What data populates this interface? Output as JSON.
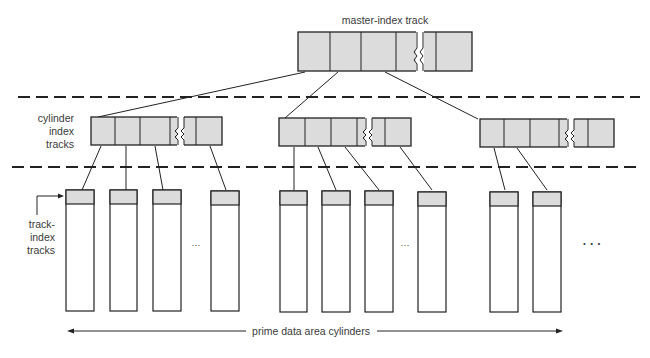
{
  "diagram": {
    "labels": {
      "master_index": "master-index track",
      "cylinder_index": [
        "cylinder",
        "index",
        "tracks"
      ],
      "track_index": [
        "track-",
        "index",
        "tracks"
      ],
      "prime_data": "prime data area cylinders",
      "ellipsis_small": "···",
      "ellipsis_large": "· · ·"
    },
    "colors": {
      "record_fill": "#dcdcdc",
      "stroke": "#222222",
      "background": "#ffffff"
    },
    "master_track": {
      "x": 298,
      "y": 32,
      "w": 174,
      "h": 39,
      "dividers": [
        330,
        361,
        396,
        436
      ],
      "break_at": 420
    },
    "cylinder_index_tracks": [
      {
        "x": 91,
        "y": 117,
        "w": 131,
        "h": 28,
        "dividers": [
          115,
          140,
          170,
          196
        ],
        "break_at": 180
      },
      {
        "x": 279,
        "y": 118,
        "w": 132,
        "h": 28,
        "dividers": [
          305,
          331,
          357,
          385
        ],
        "break_at": 368
      },
      {
        "x": 480,
        "y": 119,
        "w": 134,
        "h": 28,
        "dividers": [
          504,
          530,
          559,
          588
        ],
        "break_at": 570
      }
    ],
    "prime_cylinders": [
      66,
      110,
      153,
      211,
      280,
      322,
      365,
      418,
      490,
      533
    ]
  }
}
